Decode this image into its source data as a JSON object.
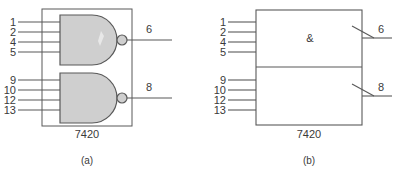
{
  "figure": {
    "device": "7420",
    "stroke_color": "#595959",
    "gate_fill_color": "#cfcfcf",
    "text_color": "#3a3a3a",
    "background_color": "#ffffff"
  },
  "diagram_a": {
    "caption": "(a)",
    "chip_label": "7420",
    "notation": "distinctive-shape",
    "gates": [
      {
        "name": "top-nand-gate",
        "type": "NAND",
        "inputs": [
          "1",
          "2",
          "4",
          "5"
        ],
        "output": "6",
        "inverting": true
      },
      {
        "name": "bottom-nand-gate",
        "type": "NAND",
        "inputs": [
          "9",
          "10",
          "12",
          "13"
        ],
        "output": "8",
        "inverting": true
      }
    ]
  },
  "diagram_b": {
    "caption": "(b)",
    "chip_label": "7420",
    "notation": "iec-rectangular",
    "qualifying_symbol": "&",
    "gates": [
      {
        "name": "top-and-block",
        "type": "AND",
        "inputs": [
          "1",
          "2",
          "4",
          "5"
        ],
        "output": "6",
        "inverting": true
      },
      {
        "name": "bottom-and-block",
        "type": "AND",
        "inputs": [
          "9",
          "10",
          "12",
          "13"
        ],
        "output": "8",
        "inverting": true
      }
    ]
  }
}
